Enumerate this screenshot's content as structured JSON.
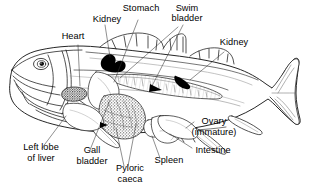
{
  "figure": {
    "background_color": "#ffffff",
    "line_color": "#1a1a1a",
    "fill_color": "#ffffff",
    "organ_dark_color": "#000000",
    "width": 312,
    "height": 195
  },
  "labels": {
    "heart": "Heart",
    "kidney_anterior": "Kidney",
    "stomach": "Stomach",
    "swim_bladder_line1": "Swim",
    "swim_bladder_line2": "bladder",
    "kidney_posterior": "Kidney",
    "left_lobe_of_liver_line1": "Left lobe",
    "left_lobe_of_liver_line2": "of liver",
    "gall_bladder_line1": "Gall",
    "gall_bladder_line2": "bladder",
    "pyloric_caeca_line1": "Pyloric",
    "pyloric_caeca_line2": "caeca",
    "spleen": "Spleen",
    "intestine": "Intestine",
    "ovary_line1": "Ovary",
    "ovary_line2": "(immature)"
  },
  "organs": [
    {
      "name": "Heart",
      "shading": "dark-stipple"
    },
    {
      "name": "Kidney",
      "shading": "solid-black"
    },
    {
      "name": "Stomach",
      "shading": "outline"
    },
    {
      "name": "Swim bladder",
      "shading": "outline-hatched"
    },
    {
      "name": "Kidney",
      "shading": "solid-black"
    },
    {
      "name": "Left lobe of liver",
      "shading": "outline"
    },
    {
      "name": "Gall bladder",
      "shading": "solid-black"
    },
    {
      "name": "Pyloric caeca",
      "shading": "stipple"
    },
    {
      "name": "Spleen",
      "shading": "outline"
    },
    {
      "name": "Intestine",
      "shading": "outline"
    },
    {
      "name": "Ovary (immature)",
      "shading": "outline"
    }
  ]
}
